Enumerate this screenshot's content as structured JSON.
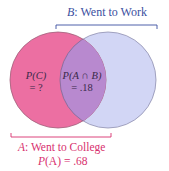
{
  "diagram": {
    "type": "venn",
    "sets": [
      {
        "id": "A",
        "letter": "A",
        "name": "Went to College",
        "probability_label": "P(A) = .68",
        "color": "#ec6fa2"
      },
      {
        "id": "B",
        "letter": "B",
        "name": "Went to Work",
        "color": "#d2d6f5"
      }
    ],
    "intersection": {
      "label": "P(A ∩ B)",
      "value": "= .18",
      "color": "#b889cf"
    },
    "region_c": {
      "label": "P(C)",
      "value": "= ?"
    },
    "label_b": {
      "letter": "B",
      "text": ": Went to Work"
    },
    "label_a": {
      "letter": "A",
      "text": ": Went to College"
    },
    "prob_a": {
      "prefix": "P",
      "arg": "(A)",
      "text": " = .68"
    }
  }
}
